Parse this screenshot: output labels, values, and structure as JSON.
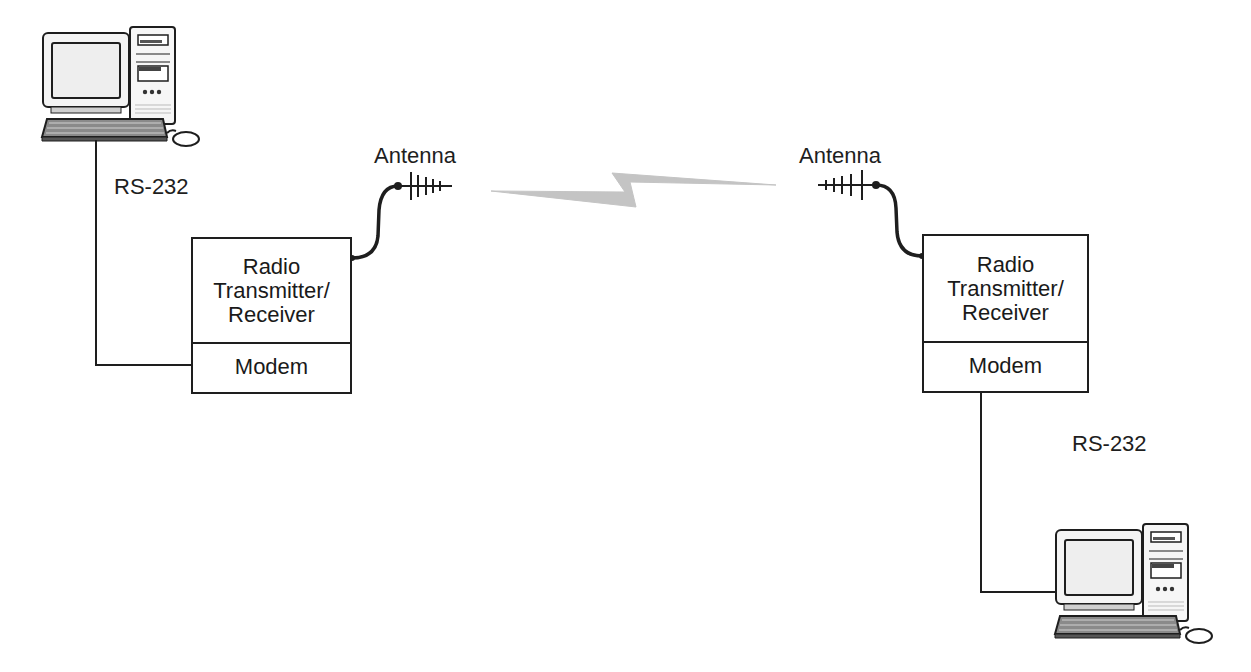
{
  "diagram": {
    "type": "radio-modem-link",
    "left_station": {
      "computer_icon": "desktop-computer-icon",
      "link_label": "RS-232",
      "unit": {
        "radio_lines": [
          "Radio",
          "Transmitter/",
          "Receiver"
        ],
        "modem_label": "Modem"
      },
      "antenna_label": "Antenna"
    },
    "right_station": {
      "computer_icon": "desktop-computer-icon",
      "link_label": "RS-232",
      "unit": {
        "radio_lines": [
          "Radio",
          "Transmitter/",
          "Receiver"
        ],
        "modem_label": "Modem"
      },
      "antenna_label": "Antenna"
    },
    "wireless_link_icon": "lightning-bolt-icon",
    "colors": {
      "line": "#1e1e1e",
      "wireless_link": "#bdbdbd",
      "background": "#ffffff"
    }
  }
}
